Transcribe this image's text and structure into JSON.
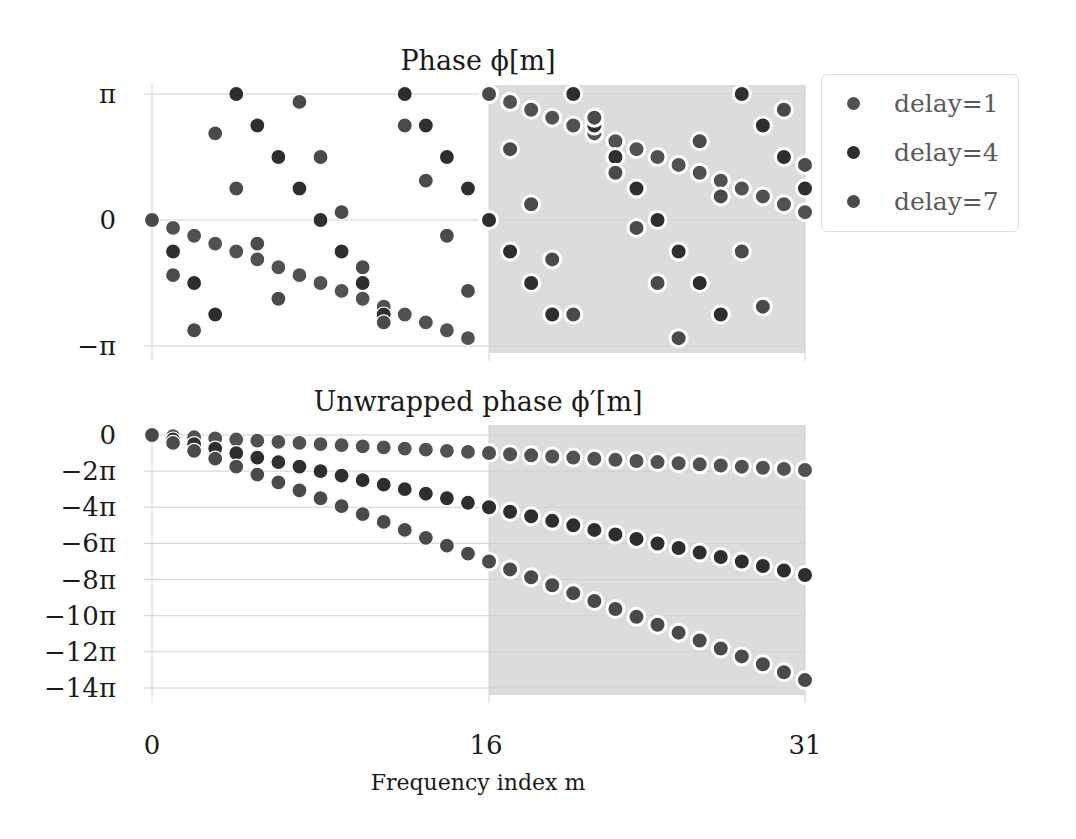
{
  "chart_data": [
    {
      "type": "scatter",
      "title": "Phase ϕ[m]",
      "xlabel": "",
      "ylabel": "",
      "x": [
        0,
        1,
        2,
        3,
        4,
        5,
        6,
        7,
        8,
        9,
        10,
        11,
        12,
        13,
        14,
        15,
        16,
        17,
        18,
        19,
        20,
        21,
        22,
        23,
        24,
        25,
        26,
        27,
        28,
        29,
        30,
        31
      ],
      "xlim": [
        0,
        31
      ],
      "ylim_pi_units": [
        -1,
        1
      ],
      "yticks": [
        {
          "value": 1,
          "label": "π"
        },
        {
          "value": 0,
          "label": "0"
        },
        {
          "value": -1,
          "label": "−π"
        }
      ],
      "grid": true,
      "shaded_region_x": [
        16,
        31
      ],
      "y_units": "pi",
      "series": [
        {
          "name": "delay=1",
          "values": [
            0,
            -0.0625,
            -0.125,
            -0.1875,
            -0.25,
            -0.3125,
            -0.375,
            -0.4375,
            -0.5,
            -0.5625,
            -0.625,
            -0.6875,
            -0.75,
            -0.8125,
            -0.875,
            -0.9375,
            1,
            0.9375,
            0.875,
            0.8125,
            0.75,
            0.6875,
            0.625,
            0.5625,
            0.5,
            0.4375,
            0.375,
            0.3125,
            0.25,
            0.1875,
            0.125,
            0.0625
          ]
        },
        {
          "name": "delay=4",
          "values": [
            0,
            -0.25,
            -0.5,
            -0.75,
            1,
            0.75,
            0.5,
            0.25,
            0,
            -0.25,
            -0.5,
            -0.75,
            1,
            0.75,
            0.5,
            0.25,
            0,
            -0.25,
            -0.5,
            -0.75,
            1,
            0.75,
            0.5,
            0.25,
            0,
            -0.25,
            -0.5,
            -0.75,
            1,
            0.75,
            0.5,
            0.25
          ]
        },
        {
          "name": "delay=7",
          "values": [
            0,
            -0.4375,
            -0.875,
            0.6875,
            0.25,
            -0.1875,
            -0.625,
            0.9375,
            0.5,
            0.0625,
            -0.375,
            -0.8125,
            0.75,
            0.3125,
            -0.125,
            -0.5625,
            1,
            0.5625,
            0.125,
            -0.3125,
            -0.75,
            0.8125,
            0.375,
            -0.0625,
            -0.5,
            -0.9375,
            0.625,
            0.1875,
            -0.25,
            -0.6875,
            0.875,
            0.4375
          ]
        }
      ]
    },
    {
      "type": "scatter",
      "title": "Unwrapped phase ϕ′[m]",
      "xlabel": "Frequency index m",
      "ylabel": "",
      "x": [
        0,
        1,
        2,
        3,
        4,
        5,
        6,
        7,
        8,
        9,
        10,
        11,
        12,
        13,
        14,
        15,
        16,
        17,
        18,
        19,
        20,
        21,
        22,
        23,
        24,
        25,
        26,
        27,
        28,
        29,
        30,
        31
      ],
      "xlim": [
        0,
        31
      ],
      "xticks": [
        {
          "value": 0,
          "label": "0"
        },
        {
          "value": 16,
          "label": "16"
        },
        {
          "value": 31,
          "label": "31"
        }
      ],
      "ylim_pi_units": [
        -14,
        0
      ],
      "yticks": [
        {
          "value": 0,
          "label": "0"
        },
        {
          "value": -2,
          "label": "−2π"
        },
        {
          "value": -4,
          "label": "−4π"
        },
        {
          "value": -6,
          "label": "−6π"
        },
        {
          "value": -8,
          "label": "−8π"
        },
        {
          "value": -10,
          "label": "−10π"
        },
        {
          "value": -12,
          "label": "−12π"
        },
        {
          "value": -14,
          "label": "−14π"
        }
      ],
      "grid": true,
      "shaded_region_x": [
        16,
        31
      ],
      "y_units": "pi",
      "series": [
        {
          "name": "delay=1",
          "values": [
            0,
            -0.0625,
            -0.125,
            -0.1875,
            -0.25,
            -0.3125,
            -0.375,
            -0.4375,
            -0.5,
            -0.5625,
            -0.625,
            -0.6875,
            -0.75,
            -0.8125,
            -0.875,
            -0.9375,
            -1,
            -1.0625,
            -1.125,
            -1.1875,
            -1.25,
            -1.3125,
            -1.375,
            -1.4375,
            -1.5,
            -1.5625,
            -1.625,
            -1.6875,
            -1.75,
            -1.8125,
            -1.875,
            -1.9375
          ]
        },
        {
          "name": "delay=4",
          "values": [
            0,
            -0.25,
            -0.5,
            -0.75,
            -1,
            -1.25,
            -1.5,
            -1.75,
            -2,
            -2.25,
            -2.5,
            -2.75,
            -3,
            -3.25,
            -3.5,
            -3.75,
            -4,
            -4.25,
            -4.5,
            -4.75,
            -5,
            -5.25,
            -5.5,
            -5.75,
            -6,
            -6.25,
            -6.5,
            -6.75,
            -7,
            -7.25,
            -7.5,
            -7.75
          ]
        },
        {
          "name": "delay=7",
          "values": [
            0,
            -0.4375,
            -0.875,
            -1.3125,
            -1.75,
            -2.1875,
            -2.625,
            -3.0625,
            -3.5,
            -3.9375,
            -4.375,
            -4.8125,
            -5.25,
            -5.6875,
            -6.125,
            -6.5625,
            -7,
            -7.4375,
            -7.875,
            -8.3125,
            -8.75,
            -9.1875,
            -9.625,
            -10.0625,
            -10.5,
            -10.9375,
            -11.375,
            -11.8125,
            -12.25,
            -12.6875,
            -13.125,
            -13.5625
          ]
        }
      ]
    }
  ],
  "figure": {
    "top_title": "Phase ϕ[m]",
    "bottom_title": "Unwrapped phase ϕ′[m]",
    "xlabel": "Frequency index m",
    "xtick_labels": [
      "0",
      "16",
      "31"
    ]
  },
  "legend": {
    "items": [
      {
        "label": "delay=1",
        "color": "#515151"
      },
      {
        "label": "delay=4",
        "color": "#2e2e2e"
      },
      {
        "label": "delay=7",
        "color": "#4a4a4a"
      }
    ]
  },
  "colors": {
    "shade": "#dcdcdc",
    "grid": "#d0d0d0",
    "marker_edge": "#ffffff"
  }
}
